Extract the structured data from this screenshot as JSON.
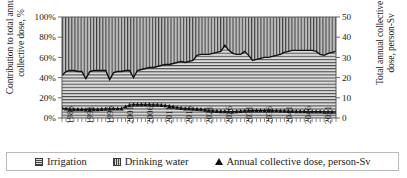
{
  "chart_data": {
    "type": "area",
    "title": "",
    "xlabel": "",
    "ylabel": "Contribution to total annual collective dose, %",
    "y2label": "Total annual collective dose, person-Sv",
    "ylim": [
      0,
      100
    ],
    "y2lim": [
      0,
      50
    ],
    "grid": false,
    "legend_position": "bottom",
    "stacked_percent": true,
    "y_ticks": [
      "0%",
      "20%",
      "40%",
      "60%",
      "80%",
      "100%"
    ],
    "y_tick_values": [
      0,
      20,
      40,
      60,
      80,
      100
    ],
    "y2_ticks": [
      "0",
      "10",
      "20",
      "30",
      "40",
      "50"
    ],
    "y2_tick_values": [
      0,
      10,
      20,
      30,
      40,
      50
    ],
    "x_tick_labels": [
      "1986",
      "1991",
      "1996",
      "2001",
      "2006",
      "2011",
      "2016",
      "2021",
      "2026",
      "2031",
      "2036",
      "2041",
      "2046",
      "2051"
    ],
    "x_tick_values": [
      1986,
      1991,
      1996,
      2001,
      2006,
      2011,
      2016,
      2021,
      2026,
      2031,
      2036,
      2041,
      2046,
      2051
    ],
    "x_start": 1986,
    "x_end": 2055,
    "legend": [
      {
        "label": "Irrigation",
        "marker": "hatch-horizontal-swatch"
      },
      {
        "label": "Drinking water",
        "marker": "hatch-vertical-swatch"
      },
      {
        "label": "Annual collective dose, person-Sv",
        "marker": "triangle-marker"
      }
    ],
    "series": [
      {
        "name": "Irrigation",
        "axis": "left",
        "unit": "%",
        "values": [
          42,
          46,
          47,
          47,
          46,
          46,
          39,
          46,
          47,
          47,
          47,
          47,
          38,
          45,
          46,
          46,
          47,
          47,
          40,
          47,
          48,
          49,
          50,
          50,
          51,
          52,
          53,
          53,
          54,
          55,
          56,
          55,
          56,
          57,
          62,
          63,
          63,
          63,
          64,
          65,
          66,
          72,
          67,
          64,
          63,
          63,
          66,
          62,
          57,
          58,
          59,
          60,
          60,
          61,
          62,
          63,
          65,
          66,
          67,
          67,
          67,
          67,
          67,
          67,
          66,
          63,
          62,
          64,
          65,
          66
        ]
      },
      {
        "name": "Drinking water",
        "axis": "left",
        "unit": "%",
        "values": [
          58,
          54,
          53,
          53,
          54,
          54,
          61,
          54,
          53,
          53,
          53,
          53,
          62,
          55,
          54,
          54,
          53,
          53,
          60,
          53,
          52,
          51,
          50,
          50,
          49,
          48,
          47,
          47,
          46,
          45,
          44,
          45,
          44,
          43,
          38,
          37,
          37,
          37,
          36,
          35,
          34,
          28,
          33,
          36,
          37,
          37,
          34,
          38,
          43,
          42,
          41,
          40,
          40,
          39,
          38,
          37,
          35,
          34,
          33,
          33,
          33,
          33,
          33,
          33,
          34,
          37,
          38,
          36,
          35,
          34
        ]
      },
      {
        "name": "Annual collective dose, person-Sv",
        "axis": "right",
        "unit": "person-Sv",
        "marker": "triangle",
        "values": [
          5.0,
          4.6,
          4.4,
          4.3,
          4.3,
          4.3,
          4.2,
          4.3,
          4.3,
          4.3,
          4.4,
          4.5,
          4.5,
          4.6,
          4.6,
          4.7,
          5.6,
          6.4,
          6.6,
          6.6,
          6.6,
          6.6,
          6.6,
          6.5,
          6.5,
          6.4,
          6.2,
          5.9,
          5.5,
          5.2,
          4.9,
          4.7,
          4.6,
          4.5,
          4.4,
          4.3,
          4.0,
          3.7,
          3.5,
          3.4,
          3.3,
          3.3,
          3.2,
          3.2,
          3.3,
          3.4,
          3.5,
          3.6,
          3.7,
          3.7,
          3.7,
          3.7,
          3.7,
          3.6,
          3.6,
          3.5,
          3.5,
          3.4,
          3.4,
          3.3,
          3.3,
          3.3,
          3.2,
          3.2,
          3.2,
          3.2,
          3.1,
          3.1,
          3.1,
          3.1
        ]
      }
    ],
    "colors": {
      "irrigation_fill": "#d5d5d5",
      "drinking_water_fill": "#9a9a9a",
      "boundary_line": "#111111",
      "dose_line": "#111111",
      "axis": "#6f6f6f",
      "plot_border": "#5a5a5a"
    }
  }
}
